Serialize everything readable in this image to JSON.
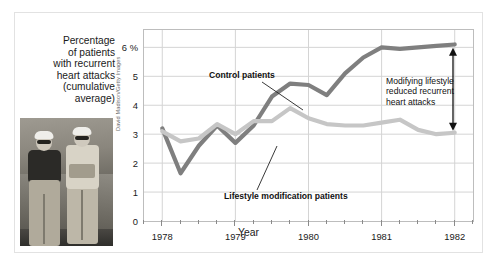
{
  "figure": {
    "y_axis_title": "Percentage of patients with recurrent heart attacks (cumulative average)",
    "y_axis_title_lines": [
      "Percentage",
      "of patients",
      "with recurrent",
      "heart attacks",
      "(cumulative",
      "average)"
    ],
    "photo_credit": "David Madison/Getty Images",
    "photo_alt": "two-anglers-photo"
  },
  "chart_data": {
    "type": "line",
    "title": "",
    "xlabel": "Year",
    "ylabel": "Percentage of patients with recurrent heart attacks (cumulative average)",
    "xlim": [
      1977.75,
      1982.25
    ],
    "ylim": [
      0,
      6.6
    ],
    "ytick_labels": [
      "6 %",
      "5",
      "4",
      "3",
      "2",
      "1",
      "0"
    ],
    "yticks": [
      6,
      5,
      4,
      3,
      2,
      1,
      0
    ],
    "xtick_labels": [
      "1978",
      "1979",
      "1980",
      "1981",
      "1982"
    ],
    "xticks": [
      1978,
      1979,
      1980,
      1981,
      1982
    ],
    "minor_xticks_per_year": 4,
    "grid": "horizontal-and-vertical",
    "legend": "inline-annotations",
    "x": [
      1978.0,
      1978.25,
      1978.5,
      1978.75,
      1979.0,
      1979.25,
      1979.5,
      1979.75,
      1980.0,
      1980.25,
      1980.5,
      1980.75,
      1981.0,
      1981.25,
      1981.5,
      1981.75,
      1982.0
    ],
    "series": [
      {
        "name": "Control patients",
        "color": "#7f7f7f",
        "values": [
          3.2,
          1.65,
          2.6,
          3.3,
          2.7,
          3.3,
          4.3,
          4.75,
          4.7,
          4.35,
          5.1,
          5.65,
          6.0,
          5.95,
          6.0,
          6.05,
          6.1
        ]
      },
      {
        "name": "Lifestyle modification patients",
        "color": "#c6c6c6",
        "values": [
          3.1,
          2.75,
          2.85,
          3.35,
          3.0,
          3.45,
          3.45,
          3.9,
          3.55,
          3.35,
          3.3,
          3.3,
          3.4,
          3.5,
          3.15,
          3.0,
          3.05
        ]
      }
    ],
    "annotations": [
      {
        "name": "control-patients",
        "text": "Control patients"
      },
      {
        "name": "lifestyle-modification-patients",
        "text": "Lifestyle modification patients"
      },
      {
        "name": "gap-callout",
        "text": "Modifying lifestyle reduced recurrent heart attacks"
      }
    ]
  }
}
